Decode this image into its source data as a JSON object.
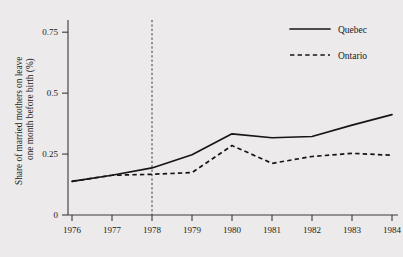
{
  "chart_data": {
    "type": "line",
    "title": "",
    "xlabel": "",
    "ylabel": "Share of married mothers on leave one month before birth (%)",
    "x": [
      1976,
      1977,
      1978,
      1979,
      1980,
      1981,
      1982,
      1983,
      1984
    ],
    "xtick_labels": [
      "1976",
      "1977",
      "1978",
      "1979",
      "1980",
      "1981",
      "1982",
      "1983",
      "1984"
    ],
    "ytick_labels": [
      "0",
      "0.25",
      "0.5",
      "0.75"
    ],
    "yticks": [
      0,
      0.25,
      0.5,
      0.75
    ],
    "ylim": [
      0,
      0.8
    ],
    "xlim": [
      1976,
      1984
    ],
    "grid": false,
    "legend_position": "top-right",
    "annotations": [
      {
        "type": "vertical-reference-line",
        "x": 1978,
        "style": "dashed",
        "label": ""
      }
    ],
    "series": [
      {
        "name": "Quebec",
        "style": "solid",
        "color": "#161616",
        "values": [
          0.138,
          0.163,
          0.193,
          0.247,
          0.333,
          0.317,
          0.322,
          0.369,
          0.412
        ]
      },
      {
        "name": "Ontario",
        "style": "dashed",
        "color": "#161616",
        "values": [
          0.138,
          0.163,
          0.167,
          0.174,
          0.285,
          0.212,
          0.24,
          0.253,
          0.245
        ]
      }
    ]
  },
  "legend": {
    "items": [
      {
        "label": "Quebec",
        "style": "solid"
      },
      {
        "label": "Ontario",
        "style": "dashed"
      }
    ]
  },
  "axes": {
    "y_axis_title": "Share of married mothers on leave one month before birth (%)"
  }
}
